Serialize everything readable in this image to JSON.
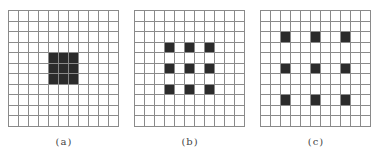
{
  "figure": {
    "grid_size": 11,
    "colors": {
      "line": "#8a8a8a",
      "filled": "#2b2b2b",
      "empty": "#ffffff"
    },
    "panels": [
      {
        "label": "(a)",
        "left": 8,
        "filled_cells": [
          [
            4,
            4
          ],
          [
            4,
            5
          ],
          [
            4,
            6
          ],
          [
            5,
            4
          ],
          [
            5,
            5
          ],
          [
            5,
            6
          ],
          [
            6,
            4
          ],
          [
            6,
            5
          ],
          [
            6,
            6
          ]
        ]
      },
      {
        "label": "(b)",
        "left": 134,
        "filled_cells": [
          [
            3,
            3
          ],
          [
            3,
            5
          ],
          [
            3,
            7
          ],
          [
            5,
            3
          ],
          [
            5,
            5
          ],
          [
            5,
            7
          ],
          [
            7,
            3
          ],
          [
            7,
            5
          ],
          [
            7,
            7
          ]
        ]
      },
      {
        "label": "(c)",
        "left": 260,
        "filled_cells": [
          [
            2,
            2
          ],
          [
            2,
            5
          ],
          [
            2,
            8
          ],
          [
            5,
            2
          ],
          [
            5,
            5
          ],
          [
            5,
            8
          ],
          [
            8,
            2
          ],
          [
            8,
            5
          ],
          [
            8,
            8
          ]
        ]
      }
    ]
  }
}
